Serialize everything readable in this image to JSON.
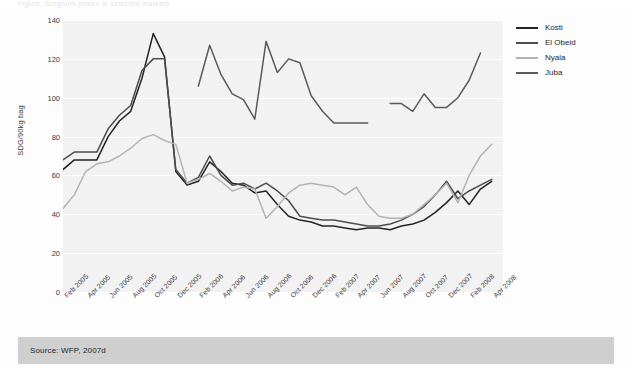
{
  "figure": {
    "source_note": "Source: WFP, 2007d",
    "ghost_top_text": "Figure: Sorghum prices in selected markets"
  },
  "colors": {
    "panel_background": "#f2f2f2",
    "gridline": "#ffffff",
    "source_bar": "#cfcfcf",
    "kosti": "#242424",
    "el_obeid": "#4d4d4d",
    "nyala": "#b3b3b3",
    "juba": "#5a5a5a"
  },
  "legend": {
    "position": "right",
    "items": [
      {
        "label": "Kosti",
        "color": "#242424"
      },
      {
        "label": "El Obeid",
        "color": "#4d4d4d"
      },
      {
        "label": "Nyala",
        "color": "#b3b3b3"
      },
      {
        "label": "Juba",
        "color": "#5a5a5a"
      }
    ]
  },
  "chart_data": {
    "type": "line",
    "title": "",
    "subtitle": "",
    "xlabel": "",
    "ylabel": "SDG/90kg bag",
    "ylim": [
      0,
      140
    ],
    "yticks": [
      0,
      20,
      40,
      60,
      80,
      100,
      120,
      140
    ],
    "grid": true,
    "legend_position": "right",
    "x_tick_labels": [
      "Feb 2005",
      "Apr 2005",
      "Jun 2005",
      "Aug 2005",
      "Oct 2005",
      "Dec 2005",
      "Feb 2006",
      "Apr 2006",
      "Jun 2006",
      "Aug 2006",
      "Oct 2006",
      "Dec 2006",
      "Feb 2007",
      "Apr 2007",
      "Jun 2007",
      "Aug 2007",
      "Oct 2007",
      "Dec 2007",
      "Feb 2008",
      "Apr 2008"
    ],
    "x_months": [
      "Feb 2005",
      "Mar 2005",
      "Apr 2005",
      "May 2005",
      "Jun 2005",
      "Jul 2005",
      "Aug 2005",
      "Sep 2005",
      "Oct 2005",
      "Nov 2005",
      "Dec 2005",
      "Jan 2006",
      "Feb 2006",
      "Mar 2006",
      "Apr 2006",
      "May 2006",
      "Jun 2006",
      "Jul 2006",
      "Aug 2006",
      "Sep 2006",
      "Oct 2006",
      "Nov 2006",
      "Dec 2006",
      "Jan 2007",
      "Feb 2007",
      "Mar 2007",
      "Apr 2007",
      "May 2007",
      "Jun 2007",
      "Jul 2007",
      "Aug 2007",
      "Sep 2007",
      "Oct 2007",
      "Nov 2007",
      "Dec 2007",
      "Jan 2008",
      "Feb 2008",
      "Mar 2008",
      "Apr 2008",
      "May 2008"
    ],
    "series": [
      {
        "name": "Kosti",
        "color": "#242424",
        "values": [
          63,
          68,
          68,
          68,
          80,
          88,
          93,
          110,
          133,
          121,
          62,
          55,
          57,
          67,
          62,
          56,
          55,
          51,
          52,
          45,
          39,
          37,
          36,
          34,
          34,
          33,
          32,
          33,
          33,
          32,
          34,
          35,
          37,
          41,
          46,
          52,
          45,
          53,
          57,
          null
        ]
      },
      {
        "name": "El Obeid",
        "color": "#4d4d4d",
        "values": [
          68,
          72,
          72,
          72,
          84,
          91,
          96,
          114,
          120,
          120,
          63,
          56,
          59,
          70,
          60,
          55,
          56,
          53,
          56,
          52,
          47,
          39,
          38,
          37,
          37,
          36,
          35,
          34,
          34,
          35,
          37,
          40,
          44,
          50,
          57,
          48,
          52,
          55,
          58,
          null
        ]
      },
      {
        "name": "Nyala",
        "color": "#b3b3b3",
        "values": [
          43,
          50,
          62,
          66,
          67,
          70,
          74,
          79,
          81,
          78,
          76,
          56,
          58,
          61,
          57,
          52,
          54,
          53,
          38,
          44,
          51,
          55,
          56,
          55,
          54,
          50,
          54,
          45,
          39,
          38,
          38,
          40,
          45,
          50,
          56,
          46,
          60,
          70,
          76,
          null
        ]
      },
      {
        "name": "Juba",
        "color": "#5a5a5a",
        "values": [
          null,
          null,
          null,
          null,
          null,
          null,
          null,
          null,
          null,
          null,
          null,
          null,
          106,
          127,
          112,
          102,
          99,
          89,
          129,
          113,
          120,
          118,
          101,
          93,
          87,
          87,
          87,
          87,
          null,
          97,
          97,
          93,
          102,
          95,
          95,
          100,
          109,
          123,
          null,
          null
        ]
      }
    ]
  }
}
